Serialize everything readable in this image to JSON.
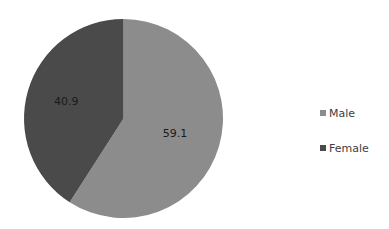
{
  "chart_data": {
    "type": "pie",
    "title": "",
    "categories": [
      "Male",
      "Female"
    ],
    "values": [
      59.1,
      40.9
    ],
    "colors": [
      "#8c8c8c",
      "#4a4a4a"
    ],
    "data_labels": [
      "59.1",
      "40.9"
    ],
    "start_angle_deg": 0,
    "direction": "clockwise",
    "legend_position": "right",
    "grid": false
  },
  "legend": {
    "items": [
      {
        "label": "Male",
        "color": "#8c8c8c"
      },
      {
        "label": "Female",
        "color": "#4a4a4a"
      }
    ]
  }
}
